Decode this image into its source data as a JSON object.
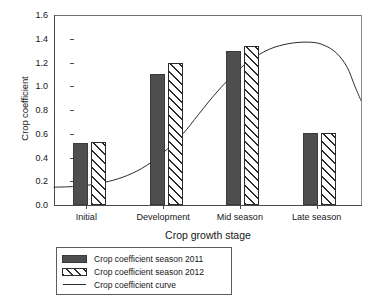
{
  "chart_data": {
    "type": "bar",
    "title": "",
    "xlabel": "Crop growth stage",
    "ylabel": "Crop coefficient",
    "categories": [
      "Initial",
      "Development",
      "Mid season",
      "Late season"
    ],
    "series": [
      {
        "name": "Crop coefficient season 2011",
        "values": [
          0.52,
          1.1,
          1.3,
          0.61
        ],
        "style": "solid-dark-gray",
        "color": "#4e4e4e"
      },
      {
        "name": "Crop coefficient season 2012",
        "values": [
          0.53,
          1.2,
          1.34,
          0.61
        ],
        "style": "diagonal-hatch",
        "color": "#ffffff"
      }
    ],
    "overlay_line": {
      "name": "Crop coefficient curve",
      "type": "line",
      "color": "#2b2b2b",
      "points": [
        [
          0.0,
          0.15
        ],
        [
          0.06,
          0.155
        ],
        [
          0.12,
          0.17
        ],
        [
          0.18,
          0.2
        ],
        [
          0.24,
          0.25
        ],
        [
          0.3,
          0.33
        ],
        [
          0.36,
          0.45
        ],
        [
          0.42,
          0.6
        ],
        [
          0.47,
          0.76
        ],
        [
          0.52,
          0.92
        ],
        [
          0.57,
          1.06
        ],
        [
          0.62,
          1.18
        ],
        [
          0.67,
          1.27
        ],
        [
          0.72,
          1.33
        ],
        [
          0.78,
          1.365
        ],
        [
          0.84,
          1.37
        ],
        [
          0.88,
          1.345
        ],
        [
          0.92,
          1.28
        ],
        [
          0.955,
          1.16
        ],
        [
          0.98,
          1.0
        ],
        [
          1.0,
          0.88
        ]
      ]
    },
    "ylim": [
      0.0,
      1.6
    ],
    "yticks": [
      "0.0",
      "0.2",
      "0.4",
      "0.6",
      "0.8",
      "1.0",
      "1.2",
      "1.4",
      "1.6"
    ],
    "ytick_values": [
      0.0,
      0.2,
      0.4,
      0.6,
      0.8,
      1.0,
      1.2,
      1.4,
      1.6
    ],
    "grid": false,
    "legend_position": "below-axis-left",
    "legend_entries": [
      "Crop coefficient season 2011",
      "Crop coefficient season 2012",
      "Crop coefficient curve"
    ]
  }
}
